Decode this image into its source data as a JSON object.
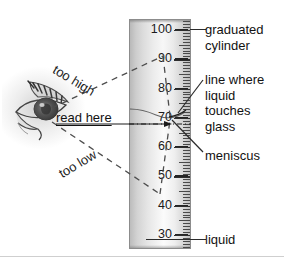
{
  "figure": {
    "background_color": "#ffffff"
  },
  "cylinder": {
    "name": "graduated cylinder",
    "scale_unit": "mL",
    "fill_level": 70,
    "scale_labels": [
      "100",
      "90",
      "80",
      "70",
      "60",
      "50",
      "40",
      "30"
    ],
    "scale_values": [
      100,
      90,
      80,
      70,
      60,
      50,
      40,
      30
    ]
  },
  "eye": {
    "name": "eye viewing the cylinder"
  },
  "annotations": {
    "read_here": "read here",
    "too_high": "too high",
    "too_low": "too low"
  },
  "callouts": {
    "graduated_cylinder_line1": "graduated",
    "graduated_cylinder_line2": "cylinder",
    "line_where_line1": "line where",
    "line_where_line2": "liquid",
    "line_where_line3": "touches",
    "line_where_line4": "glass",
    "meniscus": "meniscus",
    "liquid": "liquid"
  },
  "colors": {
    "ink": "#121212",
    "glass_outline": "#8c8c8c",
    "tick": "#2e2e2e",
    "dashed_line": "#555555",
    "rule": "#cfcfcf"
  },
  "chart_data": {
    "type": "table",
    "categories": [
      "100",
      "90",
      "80",
      "70",
      "60",
      "50",
      "40",
      "30"
    ],
    "values": [
      100,
      90,
      80,
      70,
      60,
      50,
      40,
      30
    ],
    "ylabel": "mL",
    "annotations": [
      "read here",
      "too high",
      "too low",
      "graduated cylinder",
      "line where liquid touches glass",
      "meniscus",
      "liquid"
    ]
  }
}
